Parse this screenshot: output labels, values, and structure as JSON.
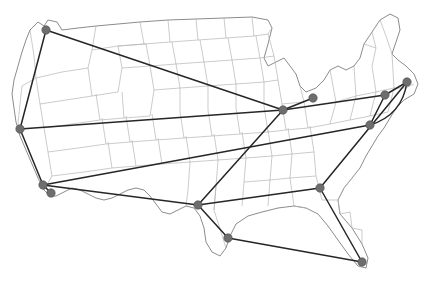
{
  "figure": {
    "background_color": "#ffffff"
  },
  "map": {
    "region_name": "United States",
    "land_fill_color": "#ebebeb",
    "state_border_color": "#b4b4b4",
    "country_border_color": "#8c8c8c"
  },
  "chart_data": {
    "type": "scatter",
    "title": "",
    "xlabel": "",
    "ylabel": "",
    "grid": false,
    "legend": null,
    "node_color": "#6e6e6e",
    "edge_color": "#262626",
    "node_radius": 4.2,
    "edge_width": 1.5,
    "nodes": [
      {
        "id": "seattle",
        "label": "Seattle",
        "x": 46,
        "y": 30
      },
      {
        "id": "san-francisco",
        "label": "San Francisco",
        "x": 20,
        "y": 129
      },
      {
        "id": "los-angeles",
        "label": "Los Angeles",
        "x": 43,
        "y": 185
      },
      {
        "id": "san-diego",
        "label": "San Diego",
        "x": 51,
        "y": 193
      },
      {
        "id": "dallas",
        "label": "Dallas",
        "x": 198,
        "y": 205
      },
      {
        "id": "houston",
        "label": "Houston",
        "x": 228,
        "y": 238
      },
      {
        "id": "chicago",
        "label": "Chicago",
        "x": 283,
        "y": 110
      },
      {
        "id": "detroit",
        "label": "Detroit",
        "x": 313,
        "y": 98
      },
      {
        "id": "atlanta",
        "label": "Atlanta",
        "x": 320,
        "y": 188
      },
      {
        "id": "miami",
        "label": "Miami",
        "x": 362,
        "y": 262
      },
      {
        "id": "washington",
        "label": "Washington DC",
        "x": 370,
        "y": 125
      },
      {
        "id": "philadelphia",
        "label": "Philadelphia",
        "x": 385,
        "y": 95
      },
      {
        "id": "new-york",
        "label": "New York",
        "x": 407,
        "y": 82
      }
    ],
    "edges": [
      {
        "from": "seattle",
        "to": "san-francisco",
        "curved": false
      },
      {
        "from": "seattle",
        "to": "chicago",
        "curved": false
      },
      {
        "from": "san-francisco",
        "to": "los-angeles",
        "curved": false
      },
      {
        "from": "san-francisco",
        "to": "chicago",
        "curved": false
      },
      {
        "from": "los-angeles",
        "to": "san-diego",
        "curved": false
      },
      {
        "from": "los-angeles",
        "to": "dallas",
        "curved": false
      },
      {
        "from": "los-angeles",
        "to": "washington",
        "curved": false
      },
      {
        "from": "dallas",
        "to": "chicago",
        "curved": false
      },
      {
        "from": "dallas",
        "to": "houston",
        "curved": false
      },
      {
        "from": "dallas",
        "to": "atlanta",
        "curved": false
      },
      {
        "from": "houston",
        "to": "miami",
        "curved": false
      },
      {
        "from": "chicago",
        "to": "detroit",
        "curved": false
      },
      {
        "from": "chicago",
        "to": "philadelphia",
        "curved": false
      },
      {
        "from": "atlanta",
        "to": "miami",
        "curved": false
      },
      {
        "from": "atlanta",
        "to": "new-york",
        "curved": false
      },
      {
        "from": "washington",
        "to": "philadelphia",
        "curved": false
      },
      {
        "from": "philadelphia",
        "to": "new-york",
        "curved": false
      },
      {
        "from": "washington",
        "to": "new-york",
        "curved": true,
        "bulge": 18
      }
    ]
  }
}
